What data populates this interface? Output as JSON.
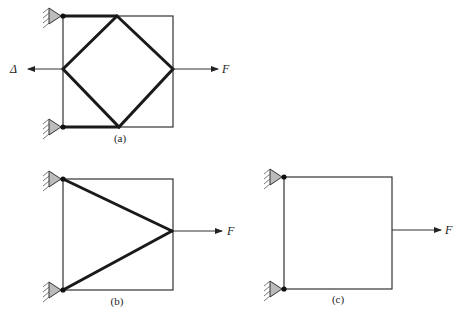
{
  "figures": [
    {
      "id": "a",
      "caption": "(a)",
      "square": {
        "x": 63,
        "y": 16,
        "w": 110,
        "h": 111
      },
      "supports": [
        {
          "x": 63,
          "y": 16
        },
        {
          "x": 63,
          "y": 127
        }
      ],
      "thick_bars": [
        [
          [
            63,
            16
          ],
          [
            117,
            16
          ]
        ],
        [
          [
            63,
            127
          ],
          [
            119,
            127
          ]
        ],
        [
          [
            117,
            16
          ],
          [
            173,
            69
          ]
        ],
        [
          [
            173,
            69
          ],
          [
            119,
            127
          ]
        ],
        [
          [
            119,
            127
          ],
          [
            63,
            69
          ]
        ],
        [
          [
            63,
            69
          ],
          [
            117,
            16
          ]
        ]
      ],
      "arrows": [
        {
          "from": [
            173,
            69
          ],
          "to": [
            218,
            69
          ],
          "label": "F",
          "label_pos": [
            222,
            73
          ]
        },
        {
          "from": [
            63,
            69
          ],
          "to": [
            28,
            69
          ],
          "label": "Δ",
          "label_pos": [
            10,
            73
          ]
        }
      ],
      "caption_pos": [
        120,
        142
      ]
    },
    {
      "id": "b",
      "caption": "(b)",
      "square": {
        "x": 63,
        "y": 179,
        "w": 110,
        "h": 111
      },
      "supports": [
        {
          "x": 63,
          "y": 179
        },
        {
          "x": 63,
          "y": 290
        }
      ],
      "thick_bars": [
        [
          [
            63,
            179
          ],
          [
            172,
            231
          ]
        ],
        [
          [
            63,
            290
          ],
          [
            172,
            231
          ]
        ]
      ],
      "arrows": [
        {
          "from": [
            173,
            231
          ],
          "to": [
            222,
            231
          ],
          "label": "F",
          "label_pos": [
            227,
            235
          ]
        }
      ],
      "caption_pos": [
        117,
        305
      ]
    },
    {
      "id": "c",
      "caption": "(c)",
      "square": {
        "x": 284,
        "y": 177,
        "w": 108,
        "h": 112
      },
      "supports": [
        {
          "x": 284,
          "y": 177
        },
        {
          "x": 284,
          "y": 289
        }
      ],
      "thick_bars": [],
      "arrows": [
        {
          "from": [
            392,
            230
          ],
          "to": [
            441,
            230
          ],
          "label": "F",
          "label_pos": [
            445,
            234
          ]
        }
      ],
      "caption_pos": [
        338,
        303
      ]
    }
  ],
  "labels": {
    "force": "F",
    "displacement": "Δ",
    "caption_a": "(a)",
    "caption_b": "(b)",
    "caption_c": "(c)"
  }
}
